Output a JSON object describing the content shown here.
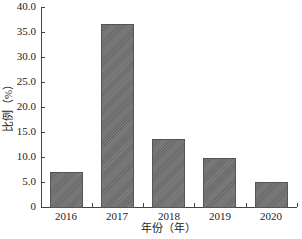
{
  "chart_data": {
    "type": "bar",
    "title": "",
    "xlabel": "年份（年）",
    "ylabel": "比例（%）",
    "categories": [
      "2016",
      "2017",
      "2018",
      "2019",
      "2020"
    ],
    "values": [
      7.0,
      36.6,
      13.6,
      9.8,
      5.0
    ],
    "ylim": [
      0,
      40
    ],
    "yticks": [
      "0",
      "5.0",
      "10.0",
      "15.0",
      "20.0",
      "25.0",
      "30.0",
      "35.0",
      "40.0"
    ],
    "grid": false,
    "legend": null,
    "bar_color": "#6e6e6e",
    "bar_pattern": "diagonal-hatch"
  }
}
